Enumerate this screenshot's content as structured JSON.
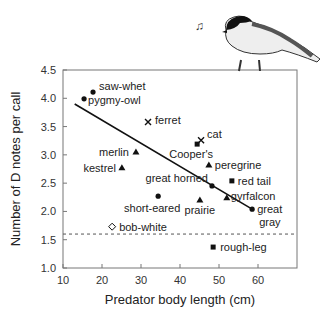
{
  "chart_data": {
    "type": "scatter",
    "title": "",
    "xlabel": "Predator body length (cm)",
    "ylabel": "Number of D notes per call",
    "xlim": [
      10,
      70
    ],
    "ylim": [
      1.0,
      4.5
    ],
    "xticks": [
      10,
      20,
      30,
      40,
      50,
      60
    ],
    "yticks": [
      "1.0",
      "1.5",
      "2.0",
      "2.5",
      "3.0",
      "3.5",
      "4.0",
      "4.5"
    ],
    "grid": false,
    "legend": "none (points labeled directly)",
    "points": [
      {
        "label": "saw-whet",
        "x": 17.7,
        "y": 4.11,
        "marker": "circle"
      },
      {
        "label": "pygmy-owl",
        "x": 15.4,
        "y": 3.99,
        "marker": "circle"
      },
      {
        "label": "ferret",
        "x": 31.8,
        "y": 3.58,
        "marker": "x"
      },
      {
        "label": "cat",
        "x": 45.4,
        "y": 3.26,
        "marker": "x"
      },
      {
        "label": "Cooper's",
        "x": 44.4,
        "y": 3.19,
        "marker": "square"
      },
      {
        "label": "merlin",
        "x": 28.7,
        "y": 3.05,
        "marker": "triangle"
      },
      {
        "label": "peregrine",
        "x": 47.4,
        "y": 2.82,
        "marker": "triangle"
      },
      {
        "label": "kestrel",
        "x": 25.1,
        "y": 2.77,
        "marker": "triangle"
      },
      {
        "label": "red tail",
        "x": 53.3,
        "y": 2.54,
        "marker": "square"
      },
      {
        "label": "great horned",
        "x": 48.2,
        "y": 2.45,
        "marker": "circle"
      },
      {
        "label": "short-eared",
        "x": 34.4,
        "y": 2.27,
        "marker": "circle"
      },
      {
        "label": "gyrfalcon",
        "x": 52.0,
        "y": 2.24,
        "marker": "triangle"
      },
      {
        "label": "prairie",
        "x": 45.1,
        "y": 2.2,
        "marker": "triangle"
      },
      {
        "label": "great gray",
        "x": 58.5,
        "y": 2.04,
        "marker": "circle"
      },
      {
        "label": "bob-white",
        "x": 22.6,
        "y": 1.73,
        "marker": "diamond-open"
      },
      {
        "label": "rough-leg",
        "x": 48.5,
        "y": 1.37,
        "marker": "square"
      }
    ],
    "regression_line": {
      "x1": 13,
      "y1": 3.9,
      "x2": 58.5,
      "y2": 2.04
    },
    "reference_line": {
      "y": 1.6,
      "style": "dashed"
    },
    "annotations": [
      "chickadee illustration perched on top-right corner with music note"
    ]
  }
}
